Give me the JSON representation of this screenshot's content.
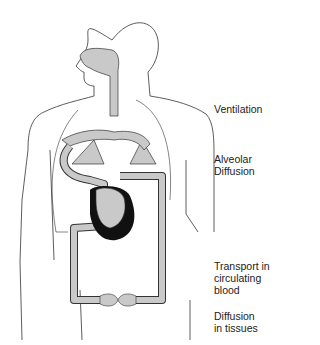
{
  "labels": {
    "ventilation": "Ventilation",
    "alveolar_1": "Alveolar",
    "alveolar_2": "Diffusion",
    "transport_1": "Transport in",
    "transport_2": "circulating",
    "transport_3": "blood",
    "diffusion_1": "Diffusion",
    "diffusion_2": "in tissues"
  },
  "colors": {
    "outline": "#333333",
    "fill": "#c9c9c9",
    "heart_dark": "#111111"
  }
}
